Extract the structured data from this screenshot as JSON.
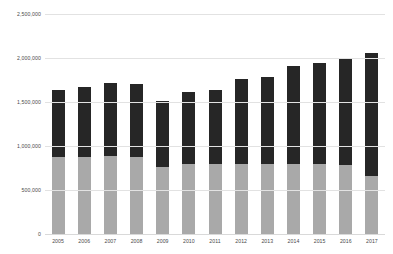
{
  "chart_data": {
    "type": "bar",
    "stacked": true,
    "title": "",
    "subtitle": "",
    "xlabel": "",
    "ylabel": "",
    "grid": true,
    "legend_position": "none",
    "categories": [
      "2005",
      "2006",
      "2007",
      "2008",
      "2009",
      "2010",
      "2011",
      "2012",
      "2013",
      "2014",
      "2015",
      "2016",
      "2017"
    ],
    "ylim": [
      0,
      2500000
    ],
    "yticks": [
      0,
      500000,
      1000000,
      1500000,
      2000000,
      2500000
    ],
    "ytick_labels": [
      "0",
      "500,000",
      "1,000,000",
      "1,500,000",
      "2,000,000",
      "2,500,000"
    ],
    "series": [
      {
        "name": "lower",
        "color": "#a9a9a9",
        "values": [
          875000,
          880000,
          885000,
          880000,
          760000,
          790000,
          800000,
          800000,
          800000,
          795000,
          790000,
          780000,
          660000
        ]
      },
      {
        "name": "upper",
        "color": "#262626",
        "values": [
          765000,
          795000,
          830000,
          830000,
          750000,
          820000,
          840000,
          965000,
          990000,
          1110000,
          1150000,
          1205000,
          1400000
        ]
      }
    ],
    "totals": [
      1640000,
      1675000,
      1715000,
      1710000,
      1510000,
      1610000,
      1640000,
      1765000,
      1790000,
      1905000,
      1940000,
      1985000,
      2060000
    ]
  }
}
